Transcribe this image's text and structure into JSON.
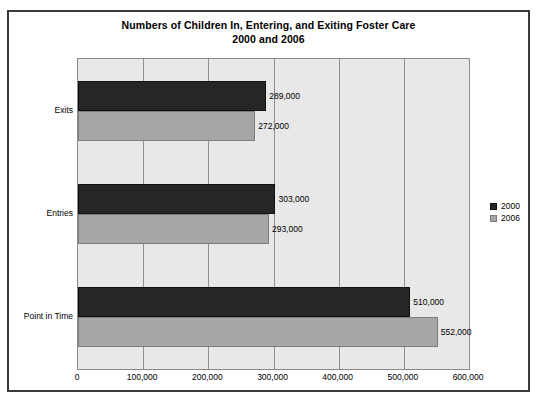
{
  "chart_data": {
    "type": "bar",
    "orientation": "horizontal",
    "title": "Numbers of Children In, Entering, and Exiting Foster Care",
    "subtitle": "2000 and 2006",
    "categories": [
      "Exits",
      "Entries",
      "Point in Time"
    ],
    "series": [
      {
        "name": "2000",
        "color": "#262626",
        "values": [
          289000,
          303000,
          510000
        ],
        "labels": [
          "289,000",
          "303,000",
          "510,000"
        ]
      },
      {
        "name": "2006",
        "color": "#a6a6a6",
        "values": [
          272000,
          293000,
          552000
        ],
        "labels": [
          "272,000",
          "293,000",
          "552,000"
        ]
      }
    ],
    "xlabel": "",
    "ylabel": "",
    "xlim": [
      0,
      600000
    ],
    "xticks": [
      0,
      100000,
      200000,
      300000,
      400000,
      500000,
      600000
    ],
    "xtick_labels": [
      "0",
      "100,000",
      "200,000",
      "300,000",
      "400,000",
      "500,000",
      "600,000"
    ],
    "grid": "vertical",
    "legend_position": "right",
    "plot_background": "#e8e8e8"
  }
}
